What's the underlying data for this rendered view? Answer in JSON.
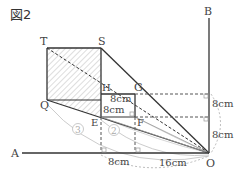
{
  "figure": {
    "title": "図2",
    "points": {
      "T": "T",
      "S": "S",
      "H": "H",
      "G": "G",
      "Q": "Q",
      "E": "E",
      "F": "F",
      "O": "O",
      "A": "A",
      "B": "B"
    },
    "measures": {
      "HG": "8cm",
      "HE": "8cm",
      "right_upper": "8cm",
      "right_lower": "8cm",
      "bottom_left": "8cm",
      "bottom_right": "16cm"
    },
    "circled": {
      "three": "3",
      "two": "2"
    }
  }
}
